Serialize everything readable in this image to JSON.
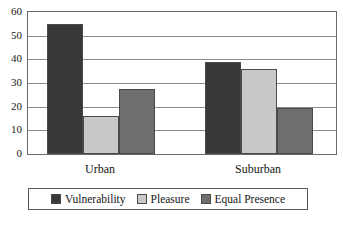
{
  "chart_data": {
    "type": "bar",
    "title": "",
    "subtitle": "",
    "xlabel": "",
    "ylabel": "",
    "categories": [
      "Urban",
      "Suburban"
    ],
    "series": [
      {
        "name": "Vulnerability",
        "color": "#383838",
        "values": [
          55,
          39
        ]
      },
      {
        "name": "Pleasure",
        "color": "#c9c9c9",
        "values": [
          16,
          36
        ]
      },
      {
        "name": "Equal Presence",
        "color": "#6e6e6e",
        "values": [
          27.5,
          19.5
        ]
      }
    ],
    "ylim": [
      0,
      60
    ],
    "ytick_step": 10,
    "yticks": [
      0,
      10,
      20,
      30,
      40,
      50,
      60
    ],
    "ytick_labels": [
      "0",
      "10",
      "20",
      "30",
      "40",
      "50",
      "60"
    ],
    "grid": true,
    "grid_axis": "y",
    "legend_position": "bottom",
    "legend_border": true,
    "annotations": []
  },
  "figure": {
    "caption": ""
  },
  "colors": {
    "axis": "#6a6a6a",
    "grid": "#8a8a8a",
    "text": "#161616",
    "background": "#ffffff",
    "bar_outline": "#4a4a4a"
  }
}
